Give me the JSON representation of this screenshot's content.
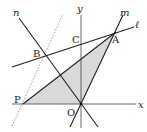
{
  "diagram": {
    "type": "coordinate-geometry",
    "axes": {
      "x_label": "x",
      "y_label": "y",
      "origin_label": "O"
    },
    "lines": [
      {
        "name": "ℓ",
        "description": "line through B, C, A"
      },
      {
        "name": "m",
        "description": "line through O and A"
      },
      {
        "name": "n",
        "description": "line through O and B"
      },
      {
        "name": "dashed",
        "description": "dotted line through P parallel to m"
      }
    ],
    "points": [
      {
        "label": "A",
        "description": "intersection of ℓ and m"
      },
      {
        "label": "B",
        "description": "intersection of ℓ and n"
      },
      {
        "label": "C",
        "description": "intersection of ℓ and y-axis"
      },
      {
        "label": "P",
        "description": "point on x-axis"
      },
      {
        "label": "O",
        "description": "origin"
      }
    ],
    "shaded_region": "triangle P-A-O",
    "shade_color": "#d9d9d9",
    "line_color": "#222222"
  },
  "labels": {
    "x": "x",
    "y": "y",
    "l": "ℓ",
    "m": "m",
    "n": "n",
    "A": "A",
    "B": "B",
    "C": "C",
    "P": "P",
    "O": "O"
  }
}
